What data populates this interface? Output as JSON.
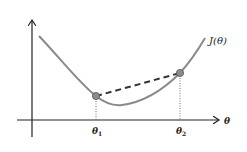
{
  "diagram": {
    "curve_label": "J(θ)",
    "x_axis_label": "θ",
    "point1_label": "θ",
    "point1_sub": "1",
    "point2_label": "θ",
    "point2_sub": "2",
    "colors": {
      "axis": "#222222",
      "curve": "#8a8a8a",
      "point_fill": "#8c8c8c",
      "point_stroke": "#555555",
      "dashed_line": "#333333"
    }
  }
}
